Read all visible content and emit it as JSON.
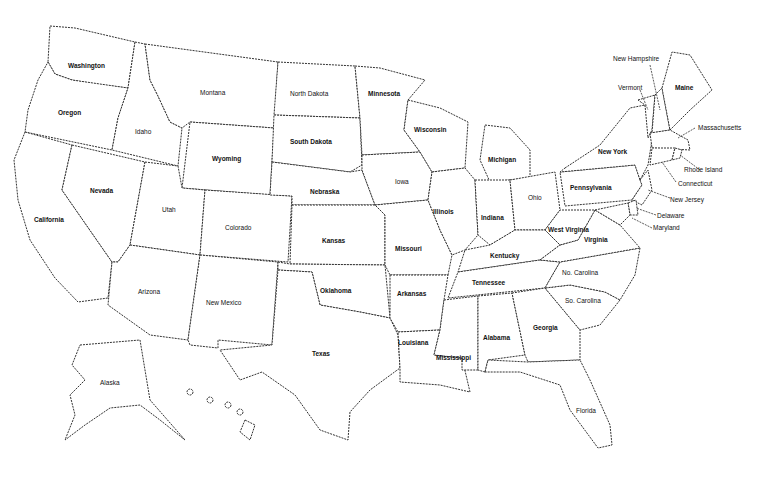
{
  "map": {
    "title": "United States",
    "stroke_color": "#333333",
    "fill_color": "#ffffff",
    "states": [
      {
        "name": "Washington"
      },
      {
        "name": "Oregon"
      },
      {
        "name": "Idaho"
      },
      {
        "name": "Montana"
      },
      {
        "name": "Wyoming"
      },
      {
        "name": "California"
      },
      {
        "name": "Nevada"
      },
      {
        "name": "Utah"
      },
      {
        "name": "Colorado"
      },
      {
        "name": "Arizona"
      },
      {
        "name": "New Mexico"
      },
      {
        "name": "North Dakota"
      },
      {
        "name": "South Dakota"
      },
      {
        "name": "Nebraska"
      },
      {
        "name": "Kansas"
      },
      {
        "name": "Oklahoma"
      },
      {
        "name": "Texas"
      },
      {
        "name": "Minnesota"
      },
      {
        "name": "Iowa"
      },
      {
        "name": "Missouri"
      },
      {
        "name": "Arkansas"
      },
      {
        "name": "Louisiana"
      },
      {
        "name": "Wisconsin"
      },
      {
        "name": "Illinois"
      },
      {
        "name": "Michigan"
      },
      {
        "name": "Indiana"
      },
      {
        "name": "Ohio"
      },
      {
        "name": "Kentucky"
      },
      {
        "name": "Tennessee"
      },
      {
        "name": "Mississippi"
      },
      {
        "name": "Alabama"
      },
      {
        "name": "Georgia"
      },
      {
        "name": "Florida"
      },
      {
        "name": "So. Carolina"
      },
      {
        "name": "No. Carolina"
      },
      {
        "name": "Virginia"
      },
      {
        "name": "West Virginia"
      },
      {
        "name": "Pennsylvania"
      },
      {
        "name": "New York"
      },
      {
        "name": "Vermont"
      },
      {
        "name": "New Hampshire"
      },
      {
        "name": "Maine"
      },
      {
        "name": "Massachusetts"
      },
      {
        "name": "Rhode Island"
      },
      {
        "name": "Connecticut"
      },
      {
        "name": "New Jersey"
      },
      {
        "name": "Delaware"
      },
      {
        "name": "Maryland"
      },
      {
        "name": "Alaska"
      },
      {
        "name": "Hawaii"
      }
    ]
  }
}
